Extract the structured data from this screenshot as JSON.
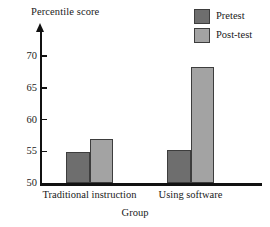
{
  "chart_data": {
    "type": "bar",
    "title": "",
    "xlabel": "Group",
    "ylabel": "Percentile score",
    "categories": [
      "Traditional instruction",
      "Using software"
    ],
    "series": [
      {
        "name": "Pretest",
        "values": [
          55.0,
          55.2
        ],
        "color": "#6e6e6e"
      },
      {
        "name": "Post-test",
        "values": [
          57.0,
          68.2
        ],
        "color": "#a3a3a3"
      }
    ],
    "ylim": [
      50,
      72
    ],
    "yticks": [
      50,
      55,
      60,
      65,
      70
    ],
    "ytick_labels": [
      "50",
      "55",
      "60",
      "65",
      "70"
    ],
    "grid": false,
    "legend_position": "top-right",
    "axis_color": "#111111",
    "bar_border_color": "#3d3d3d"
  },
  "axes": {
    "y_title": "Percentile score",
    "x_title": "Group"
  },
  "legend": {
    "entries": [
      {
        "label": "Pretest"
      },
      {
        "label": "Post-test"
      }
    ]
  }
}
